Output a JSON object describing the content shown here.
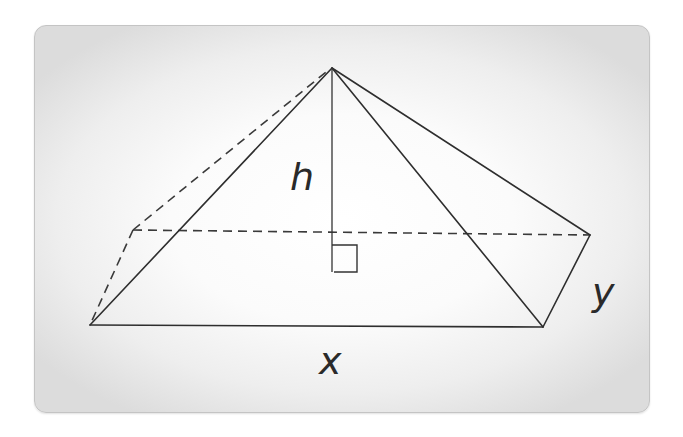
{
  "figure": {
    "type": "rectangular-pyramid",
    "background": {
      "inner": "#ffffff",
      "outer": "#dcdcdc",
      "border": "#c4c4c4"
    },
    "stroke_color": "#2e2e2e",
    "vertices": {
      "apex": [
        332,
        68
      ],
      "front_left": [
        90,
        325
      ],
      "front_right": [
        543,
        327
      ],
      "back_right": [
        590,
        235
      ],
      "back_left": [
        133,
        230
      ],
      "height_foot": [
        332,
        272
      ]
    },
    "labels": {
      "height": "h",
      "length": "x",
      "width": "y"
    },
    "right_angle_marker": true
  }
}
